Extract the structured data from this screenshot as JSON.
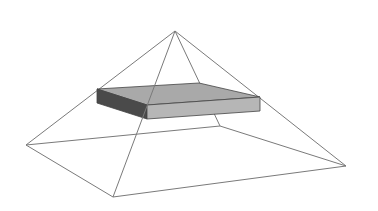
{
  "diagram": {
    "title": "",
    "colors": {
      "background": "#ffffff",
      "edge": "#7a7a7a",
      "slab_top": "#a9a9a9",
      "slab_front": "#b6b6b6",
      "slab_left": "#4a4a4a",
      "slab_outline": "#444444"
    },
    "pyramid": {
      "apex": [
        175,
        31
      ],
      "base": {
        "left": [
          26,
          145
        ],
        "front": [
          113,
          197
        ],
        "right": [
          346,
          166
        ],
        "back": [
          220,
          126
        ]
      }
    },
    "slab": {
      "top": {
        "left": [
          97,
          89
        ],
        "back": [
          199,
          83
        ],
        "right": [
          260,
          97
        ],
        "front": [
          147,
          105
        ]
      },
      "thickness": 14
    }
  }
}
